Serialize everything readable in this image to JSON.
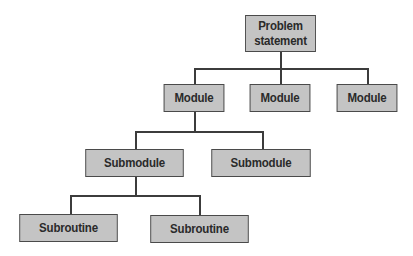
{
  "diagram": {
    "type": "hierarchy-tree",
    "colors": {
      "node_fill": "#c4c4c4",
      "node_border": "#4a4a4a",
      "connector": "#3c3c3c",
      "text": "#2a2a2a",
      "background": "#ffffff"
    },
    "root": {
      "label_line1": "Problem",
      "label_line2": "statement"
    },
    "modules": [
      {
        "label": "Module"
      },
      {
        "label": "Module"
      },
      {
        "label": "Module"
      }
    ],
    "submodules": [
      {
        "label": "Submodule"
      },
      {
        "label": "Submodule"
      }
    ],
    "subroutines": [
      {
        "label": "Subroutine"
      },
      {
        "label": "Subroutine"
      }
    ],
    "edges": [
      {
        "from": "Problem statement",
        "to": "Module 1"
      },
      {
        "from": "Problem statement",
        "to": "Module 2"
      },
      {
        "from": "Problem statement",
        "to": "Module 3"
      },
      {
        "from": "Module 1",
        "to": "Submodule 1"
      },
      {
        "from": "Module 1",
        "to": "Submodule 2"
      },
      {
        "from": "Submodule 1",
        "to": "Subroutine 1"
      },
      {
        "from": "Submodule 1",
        "to": "Subroutine 2"
      }
    ]
  }
}
